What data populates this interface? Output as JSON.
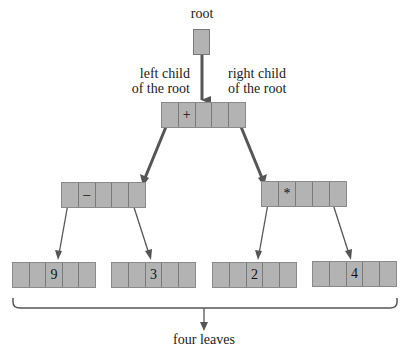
{
  "labels": {
    "root": "root",
    "left_child_line1": "left child",
    "left_child_line2": "of the root",
    "right_child_line1": "right child",
    "right_child_line2": "of the root",
    "leaves": "four leaves"
  },
  "nodes": {
    "root_child": {
      "cells": [
        "",
        "+",
        "",
        "",
        ""
      ]
    },
    "left": {
      "cells": [
        "",
        "–",
        "",
        "",
        ""
      ]
    },
    "right": {
      "cells": [
        "",
        "*",
        "",
        "",
        ""
      ]
    },
    "leaf1": {
      "cells": [
        "",
        "",
        "9",
        "",
        ""
      ]
    },
    "leaf2": {
      "cells": [
        "",
        "",
        "3",
        "",
        ""
      ]
    },
    "leaf3": {
      "cells": [
        "",
        "",
        "2",
        "",
        ""
      ]
    },
    "leaf4": {
      "cells": [
        "",
        "",
        "4",
        "",
        ""
      ]
    }
  },
  "colors": {
    "node_fill": "#b3b3b3",
    "arrow": "#555555"
  }
}
